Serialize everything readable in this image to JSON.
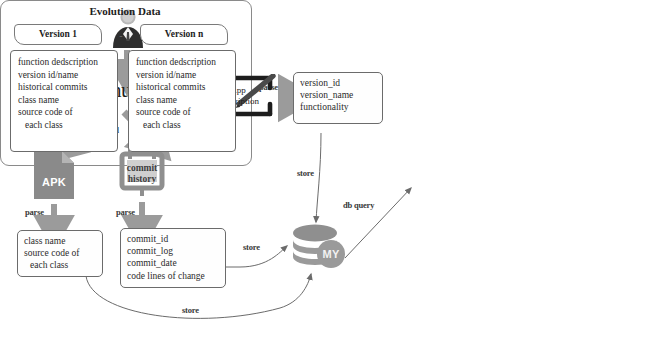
{
  "diagram": {
    "colors": {
      "arrow_gray": "#9b9b9b",
      "thin_line": "#6b6b6b",
      "box_border": "#6b6b6b",
      "apk_fill": "#8a8a8a",
      "db_fill": "#9a9a9a",
      "text": "#2b2b2b"
    }
  },
  "nodes": {
    "person": {
      "icon": "user-avatar-icon",
      "label": ""
    },
    "github": {
      "icon": "github-logo-icon",
      "label": "github"
    },
    "app_description": {
      "icon": "pen-write-icon",
      "label": "App\nDescription",
      "line1": "App",
      "line2": "Description"
    },
    "apk": {
      "icon": "file-document-icon",
      "label": "APK"
    },
    "commit_history": {
      "icon": "calendar-notebook-icon",
      "label": "commit\nhistory",
      "line1": "commit",
      "line2": "history"
    },
    "database": {
      "icon": "database-cylinder-icon",
      "label": "MY"
    }
  },
  "field_boxes": {
    "version_meta": {
      "name": "version-metadata-box",
      "lines": [
        "version_id",
        "version_name",
        "functionality"
      ]
    },
    "class_info": {
      "name": "class-info-box",
      "lines": [
        "class name",
        "source code of",
        "each class"
      ],
      "indent": [
        false,
        false,
        true
      ]
    },
    "commit_info": {
      "name": "commit-info-box",
      "lines": [
        "commit_id",
        "commit_log",
        "commit_date",
        "code lines of change"
      ]
    }
  },
  "evolution": {
    "title": "Evolution Data",
    "dash": "-",
    "versions": [
      {
        "tag": "Version 1",
        "lines": [
          "function dedscription",
          "version id/name",
          "historical commits",
          "class name",
          "source code of",
          "each class"
        ],
        "indent": [
          false,
          false,
          false,
          false,
          false,
          true
        ]
      },
      {
        "tag": "Version n",
        "lines": [
          "function dedscription",
          "version id/name",
          "historical commits",
          "class name",
          "source code of",
          "each class"
        ],
        "indent": [
          false,
          false,
          false,
          false,
          false,
          true
        ]
      }
    ]
  },
  "edges": {
    "crawl": "crawl",
    "upload_appdesc": "upload",
    "upload_apk": "upload",
    "upload_commits": "upload",
    "parse_appdesc": "parse",
    "parse_apk": "parse",
    "parse_commits": "parse",
    "store_version": "store",
    "store_commit": "store",
    "store_class": "store",
    "db_query": "db query"
  }
}
